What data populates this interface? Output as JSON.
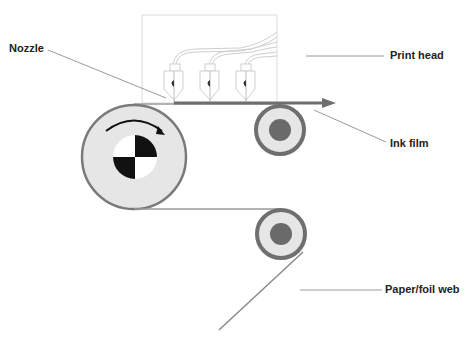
{
  "diagram": {
    "labels": {
      "nozzle": "Nozzle",
      "print_head": "Print head",
      "ink_film": "Ink film",
      "paper_web": "Paper/foil web"
    },
    "colors": {
      "roller_ring": "#7a7a7a",
      "roller_fill": "#e6e6e6",
      "roller_hub": "#6a6a6a",
      "ink_film": "#6e6e6e",
      "leader": "#9a9a9a",
      "head_outline": "#d8d8d8",
      "checker_dark": "#111111"
    },
    "components": [
      "print-head",
      "nozzles",
      "ink-film",
      "main-roller",
      "upper-guide-roller",
      "lower-guide-roller",
      "paper-web"
    ],
    "nozzle_count": 3
  }
}
